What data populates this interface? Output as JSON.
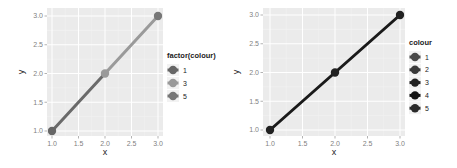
{
  "chart_data": [
    {
      "type": "line",
      "title": "",
      "xlabel": "x",
      "ylabel": "y",
      "xlim": [
        1.0,
        3.0
      ],
      "ylim": [
        1.0,
        3.0
      ],
      "x_ticks": [
        "1.0",
        "1.5",
        "2.0",
        "2.5",
        "3.0"
      ],
      "y_ticks": [
        "1.0",
        "1.5",
        "2.0",
        "2.5",
        "3.0"
      ],
      "grid": true,
      "background": "#ebebeb",
      "points": [
        {
          "x": 1,
          "y": 1,
          "colour": "1",
          "color_hex": "#666666"
        },
        {
          "x": 2,
          "y": 2,
          "colour": "3",
          "color_hex": "#9a9a9a"
        },
        {
          "x": 3,
          "y": 3,
          "colour": "5",
          "color_hex": "#777777"
        }
      ],
      "segments": [
        {
          "from": [
            1,
            1
          ],
          "to": [
            2,
            2
          ],
          "color_hex": "#6a6a6a"
        },
        {
          "from": [
            2,
            2
          ],
          "to": [
            3,
            3
          ],
          "color_hex": "#9a9a9a"
        }
      ],
      "legend": {
        "title": "factor(colour)",
        "position": "right",
        "entries": [
          {
            "label": "1",
            "color_hex": "#666666"
          },
          {
            "label": "3",
            "color_hex": "#9a9a9a"
          },
          {
            "label": "5",
            "color_hex": "#777777"
          }
        ]
      }
    },
    {
      "type": "line",
      "title": "",
      "xlabel": "x",
      "ylabel": "y",
      "xlim": [
        1.0,
        3.0
      ],
      "ylim": [
        1.0,
        3.0
      ],
      "x_ticks": [
        "1.0",
        "1.5",
        "2.0",
        "2.5",
        "3.0"
      ],
      "y_ticks": [
        "1.0",
        "1.5",
        "2.0",
        "2.5",
        "3.0"
      ],
      "grid": true,
      "background": "#ebebeb",
      "points": [
        {
          "x": 1,
          "y": 1,
          "color_hex": "#222222"
        },
        {
          "x": 2,
          "y": 2,
          "color_hex": "#222222"
        },
        {
          "x": 3,
          "y": 3,
          "color_hex": "#222222"
        }
      ],
      "segments": [
        {
          "from": [
            1,
            1
          ],
          "to": [
            3,
            3
          ],
          "color_hex": "#1a1a1a"
        }
      ],
      "legend": {
        "title": "colour",
        "position": "right",
        "entries": [
          {
            "label": "1",
            "color_hex": "#4a4a4a"
          },
          {
            "label": "2",
            "color_hex": "#3a3a3a"
          },
          {
            "label": "3",
            "color_hex": "#222222"
          },
          {
            "label": "4",
            "color_hex": "#111111"
          },
          {
            "label": "5",
            "color_hex": "#2a2a2a"
          }
        ]
      }
    }
  ]
}
